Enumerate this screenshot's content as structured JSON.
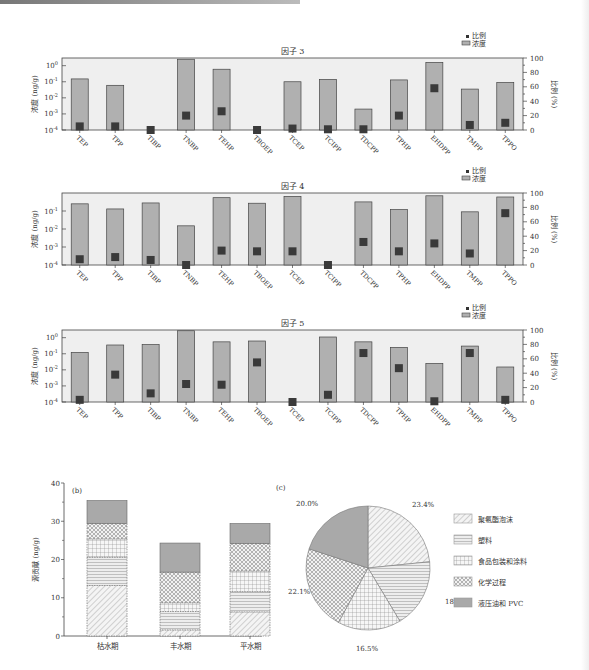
{
  "figure": {
    "factor_panels_common": {
      "categories": [
        "TEP",
        "TPP",
        "TIBP",
        "TNBP",
        "TEHP",
        "TBOEP",
        "TCEP",
        "TCIPP",
        "TDCPP",
        "TPHP",
        "EHDPP",
        "TMPP",
        "TPPO"
      ],
      "left_axis_label": "浓度 (ng/g)",
      "right_axis_label": "比例 (%)",
      "legend": [
        {
          "symbol": "square-marker",
          "label": "比例"
        },
        {
          "symbol": "bar",
          "label": "浓度"
        }
      ],
      "right_ticks": [
        "0",
        "20",
        "40",
        "60",
        "80",
        "100"
      ]
    }
  },
  "chart_data": [
    {
      "type": "bar",
      "title": "因子 3",
      "xlabel": "",
      "ylabel": "浓度 (ng/g)",
      "y_scale": "log",
      "ylim": [
        0.0001,
        3
      ],
      "y_ticks": [
        "10⁻⁴",
        "10⁻³",
        "10⁻²",
        "10⁻¹",
        "10⁰"
      ],
      "y2label": "比例 (%)",
      "y2lim": [
        0,
        100
      ],
      "categories": [
        "TEP",
        "TPP",
        "TIBP",
        "TNBP",
        "TEHP",
        "TBOEP",
        "TCEP",
        "TCIPP",
        "TDCPP",
        "TPHP",
        "EHDPP",
        "TMPP",
        "TPPO"
      ],
      "series": [
        {
          "name": "浓度",
          "kind": "bar",
          "values": [
            0.15,
            0.06,
            0.0001,
            2.5,
            0.6,
            0.0001,
            0.1,
            0.14,
            0.002,
            0.13,
            1.6,
            0.035,
            0.09
          ]
        },
        {
          "name": "比例",
          "kind": "marker",
          "axis": "right",
          "values": [
            5,
            5,
            0,
            20,
            26,
            0,
            2,
            1,
            1,
            20,
            58,
            7,
            10
          ]
        }
      ],
      "legend_position": "top-right"
    },
    {
      "type": "bar",
      "title": "因子 4",
      "xlabel": "",
      "ylabel": "浓度 (ng/g)",
      "y_scale": "log",
      "ylim": [
        0.0001,
        1
      ],
      "y_ticks": [
        "10⁻⁴",
        "10⁻³",
        "10⁻²",
        "10⁻¹"
      ],
      "y2label": "比例 (%)",
      "y2lim": [
        0,
        100
      ],
      "categories": [
        "TEP",
        "TPP",
        "TIBP",
        "TNBP",
        "TEHP",
        "TBOEP",
        "TCEP",
        "TCIPP",
        "TDCPP",
        "TPHP",
        "EHDPP",
        "TMPP",
        "TPPO"
      ],
      "series": [
        {
          "name": "浓度",
          "kind": "bar",
          "values": [
            0.25,
            0.13,
            0.28,
            0.015,
            0.55,
            0.27,
            0.65,
            0.0001,
            0.32,
            0.12,
            0.7,
            0.09,
            0.6
          ]
        },
        {
          "name": "比例",
          "kind": "marker",
          "axis": "right",
          "values": [
            8,
            11,
            7,
            0,
            20,
            19,
            19,
            0,
            32,
            19,
            30,
            16,
            72
          ]
        }
      ],
      "legend_position": "top-right"
    },
    {
      "type": "bar",
      "title": "因子 5",
      "xlabel": "",
      "ylabel": "浓度 (ng/g)",
      "y_scale": "log",
      "ylim": [
        0.0001,
        3
      ],
      "y_ticks": [
        "10⁻⁴",
        "10⁻³",
        "10⁻²",
        "10⁻¹",
        "10⁰"
      ],
      "y2label": "比例 (%)",
      "y2lim": [
        0,
        100
      ],
      "categories": [
        "TEP",
        "TPP",
        "TIBP",
        "TNBP",
        "TEHP",
        "TBOEP",
        "TCEP",
        "TCIPP",
        "TDCPP",
        "TPHP",
        "EHDPP",
        "TMPP",
        "TPPO"
      ],
      "series": [
        {
          "name": "浓度",
          "kind": "bar",
          "values": [
            0.12,
            0.35,
            0.37,
            2.7,
            0.55,
            0.62,
            0.0001,
            1.1,
            0.55,
            0.25,
            0.025,
            0.3,
            0.015
          ]
        },
        {
          "name": "比例",
          "kind": "marker",
          "axis": "right",
          "values": [
            3,
            38,
            12,
            25,
            24,
            55,
            0,
            10,
            68,
            47,
            1,
            68,
            3
          ]
        }
      ],
      "legend_position": "top-right"
    },
    {
      "type": "bar",
      "stacked": true,
      "panel_label": "(b)",
      "title": "",
      "xlabel": "",
      "ylabel": "源贡献 (ng/g)",
      "ylim": [
        0,
        40
      ],
      "y_ticks": [
        "0",
        "10",
        "20",
        "30",
        "40"
      ],
      "categories": [
        "枯水期",
        "丰水期",
        "平水期"
      ],
      "series": [
        {
          "name": "聚氨酯泡沫",
          "pattern": "diagonal-hatch",
          "values": [
            13.2,
            1.6,
            6.3
          ]
        },
        {
          "name": "塑料",
          "pattern": "horizontal-lines",
          "values": [
            7.4,
            4.8,
            5.3
          ]
        },
        {
          "name": "食品包装和涂料",
          "pattern": "grid",
          "values": [
            4.8,
            2.3,
            5.4
          ]
        },
        {
          "name": "化学过程",
          "pattern": "crosshatch",
          "values": [
            4.0,
            8.0,
            7.2
          ]
        },
        {
          "name": "液压油和PVC",
          "pattern": "solid-gray",
          "values": [
            6.0,
            7.6,
            5.2
          ]
        }
      ],
      "totals": [
        35.4,
        24.3,
        29.4
      ],
      "grid": false
    },
    {
      "type": "pie",
      "panel_label": "(c)",
      "title": "",
      "labels": [
        "聚氨酯泡沫",
        "塑料",
        "食品包装和涂料",
        "化学过程",
        "液压油和 PVC"
      ],
      "values": [
        23.4,
        18.0,
        16.5,
        22.1,
        20.0
      ],
      "value_labels": [
        "23.4%",
        "18.0%",
        "16.5%",
        "22.1%",
        "20.0%"
      ],
      "legend_position": "right"
    }
  ]
}
